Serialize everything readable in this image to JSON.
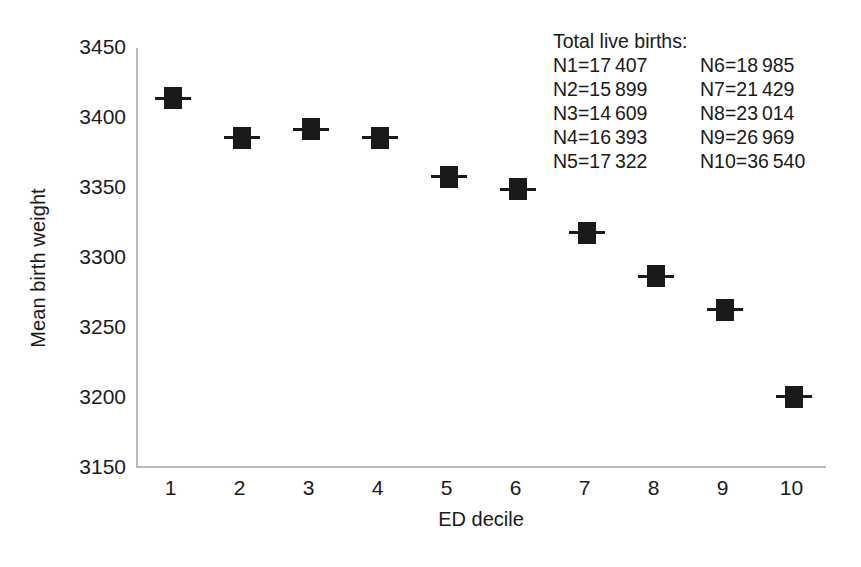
{
  "chart_data": {
    "type": "scatter",
    "title": "",
    "xlabel": "ED decile",
    "ylabel": "Mean birth weight",
    "categories": [
      "1",
      "2",
      "3",
      "4",
      "5",
      "6",
      "7",
      "8",
      "9",
      "10"
    ],
    "x": [
      1,
      2,
      3,
      4,
      5,
      6,
      7,
      8,
      9,
      10
    ],
    "values": [
      3414,
      3386,
      3392,
      3386,
      3358,
      3349,
      3318,
      3287,
      3263,
      3201
    ],
    "series": [
      {
        "name": "Mean birth weight",
        "values": [
          3414,
          3386,
          3392,
          3386,
          3358,
          3349,
          3318,
          3287,
          3263,
          3201
        ]
      }
    ],
    "xlim": [
      0.5,
      10.5
    ],
    "ylim": [
      3150,
      3450
    ],
    "yticks": [
      "3450",
      "3400",
      "3350",
      "3300",
      "3250",
      "3200",
      "3150"
    ],
    "ytick_values": [
      3450,
      3400,
      3350,
      3300,
      3250,
      3200,
      3150
    ],
    "xticks": [
      "1",
      "2",
      "3",
      "4",
      "5",
      "6",
      "7",
      "8",
      "9",
      "10"
    ],
    "grid": false,
    "legend": "none",
    "marker_style": "filled-square-with-horizontal-error-bar",
    "marker_color": "#1a1a1a",
    "axis_color": "#b9b9b9"
  },
  "annotation": {
    "title": "Total live births:",
    "rows": [
      {
        "left": "N1=17 407",
        "right": "N6=18 985"
      },
      {
        "left": "N2=15 899",
        "right": "N7=21 429"
      },
      {
        "left": "N3=14 609",
        "right": "N8=23 014"
      },
      {
        "left": "N4=16 393",
        "right": "N9=26 969"
      },
      {
        "left": "N5=17 322",
        "right": "N10=36 540"
      }
    ]
  }
}
